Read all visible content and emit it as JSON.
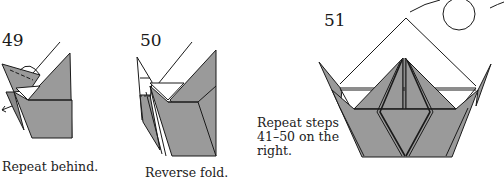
{
  "steps": [
    {
      "number": "49",
      "caption": "Repeat behind."
    },
    {
      "number": "50",
      "caption": "Reverse fold."
    },
    {
      "number": "51",
      "caption": ""
    }
  ],
  "instruction": {
    "line1": "Repeat steps",
    "line2": "41–50 on the",
    "line3": "right."
  },
  "colors": {
    "paper_gray": "#9a9a9a",
    "paper_white": "#ffffff",
    "line": "#1a1a1a"
  }
}
